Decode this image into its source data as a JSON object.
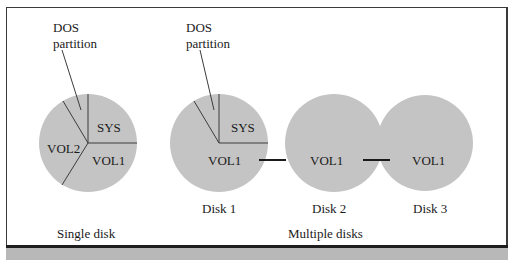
{
  "figure": {
    "fill_color": "#c4c4c4",
    "line_color": "#3c3c3c",
    "single_disk": {
      "caption": "Single disk",
      "callout": {
        "line1": "DOS",
        "line2": "partition"
      },
      "segments": [
        "SYS",
        "VOL1",
        "VOL2"
      ]
    },
    "multiple_disks": {
      "caption": "Multiple disks",
      "callout": {
        "line1": "DOS",
        "line2": "partition"
      },
      "disks": [
        {
          "label": "Disk 1",
          "segments": [
            "SYS",
            "VOL1"
          ]
        },
        {
          "label": "Disk 2",
          "segments": [
            "VOL1"
          ]
        },
        {
          "label": "Disk 3",
          "segments": [
            "VOL1"
          ]
        }
      ]
    }
  }
}
